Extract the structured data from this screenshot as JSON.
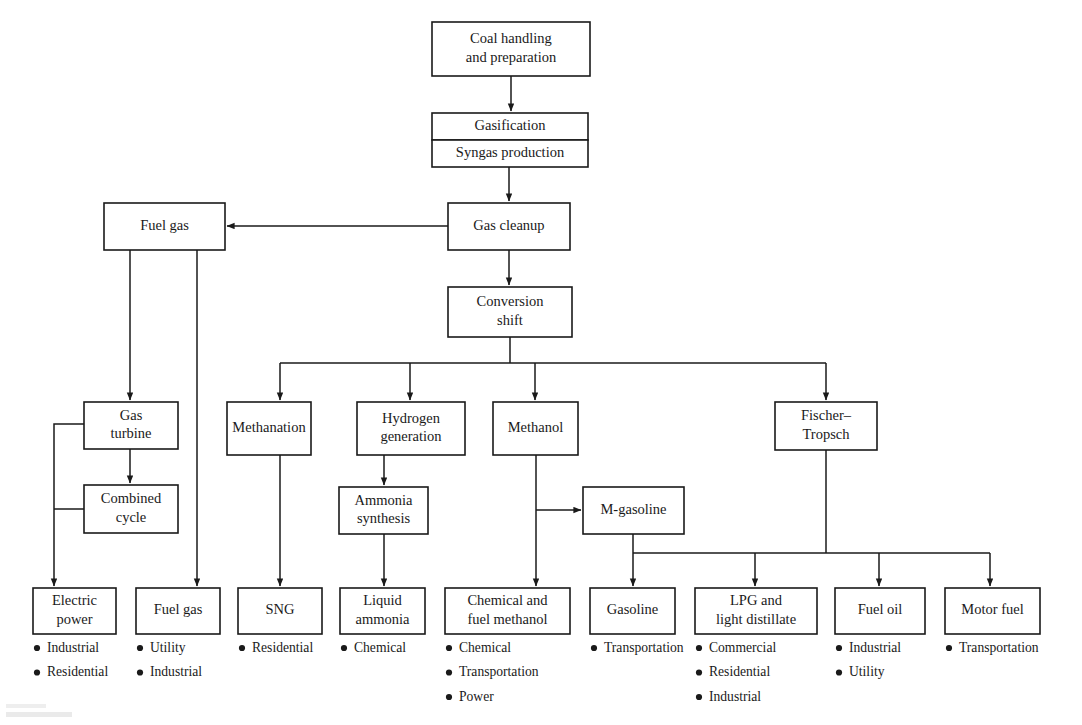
{
  "diagram": {
    "line_color": "#1a1a1a",
    "box_fill": "#ffffff",
    "background": "#ffffff",
    "nodes": [
      {
        "id": "coal_handling",
        "label_lines": [
          "Coal handling",
          "and preparation"
        ],
        "x": 432,
        "y": 22,
        "w": 158,
        "h": 54
      },
      {
        "id": "gasification",
        "label_lines": [
          "Gasification"
        ],
        "x": 432,
        "y": 113,
        "w": 156,
        "h": 27
      },
      {
        "id": "syngas",
        "label_lines": [
          "Syngas production"
        ],
        "x": 432,
        "y": 140,
        "w": 156,
        "h": 27
      },
      {
        "id": "fuel_gas_top",
        "label_lines": [
          "Fuel gas"
        ],
        "x": 104,
        "y": 203,
        "w": 121,
        "h": 47
      },
      {
        "id": "gas_cleanup",
        "label_lines": [
          "Gas cleanup"
        ],
        "x": 448,
        "y": 203,
        "w": 122,
        "h": 47
      },
      {
        "id": "conversion_shift",
        "label_lines": [
          "Conversion",
          "shift"
        ],
        "x": 448,
        "y": 287,
        "w": 124,
        "h": 50
      },
      {
        "id": "gas_turbine",
        "label_lines": [
          "Gas",
          "turbine"
        ],
        "x": 84,
        "y": 402,
        "w": 94,
        "h": 47
      },
      {
        "id": "methanation",
        "label_lines": [
          "Methanation"
        ],
        "x": 227,
        "y": 402,
        "w": 84,
        "h": 53
      },
      {
        "id": "hydrogen_gen",
        "label_lines": [
          "Hydrogen",
          "generation"
        ],
        "x": 357,
        "y": 402,
        "w": 108,
        "h": 53
      },
      {
        "id": "methanol",
        "label_lines": [
          "Methanol"
        ],
        "x": 493,
        "y": 402,
        "w": 85,
        "h": 53
      },
      {
        "id": "fischer_tropsch",
        "label_lines": [
          "Fischer–",
          "Tropsch"
        ],
        "x": 775,
        "y": 402,
        "w": 102,
        "h": 48
      },
      {
        "id": "combined_cycle",
        "label_lines": [
          "Combined",
          "cycle"
        ],
        "x": 84,
        "y": 485,
        "w": 94,
        "h": 48
      },
      {
        "id": "ammonia_synth",
        "label_lines": [
          "Ammonia",
          "synthesis"
        ],
        "x": 339,
        "y": 487,
        "w": 89,
        "h": 47
      },
      {
        "id": "m_gasoline",
        "label_lines": [
          "M-gasoline"
        ],
        "x": 583,
        "y": 487,
        "w": 101,
        "h": 47
      }
    ],
    "terminals": [
      {
        "id": "electric_power",
        "label_lines": [
          "Electric",
          "power"
        ],
        "x": 33,
        "y": 588,
        "w": 83,
        "h": 46,
        "bullets": [
          "Industrial",
          "Residential"
        ]
      },
      {
        "id": "fuel_gas_bottom",
        "label_lines": [
          "Fuel gas"
        ],
        "x": 136,
        "y": 588,
        "w": 84,
        "h": 46,
        "bullets": [
          "Utility",
          "Industrial"
        ]
      },
      {
        "id": "sng",
        "label_lines": [
          "SNG"
        ],
        "x": 238,
        "y": 588,
        "w": 84,
        "h": 46,
        "bullets": [
          "Residential"
        ]
      },
      {
        "id": "liquid_ammonia",
        "label_lines": [
          "Liquid",
          "ammonia"
        ],
        "x": 340,
        "y": 588,
        "w": 85,
        "h": 46,
        "bullets": [
          "Chemical"
        ]
      },
      {
        "id": "chem_fuel_meoh",
        "label_lines": [
          "Chemical and",
          "fuel methanol"
        ],
        "x": 445,
        "y": 588,
        "w": 125,
        "h": 46,
        "bullets": [
          "Chemical",
          "Transportation",
          "Power"
        ]
      },
      {
        "id": "gasoline",
        "label_lines": [
          "Gasoline"
        ],
        "x": 590,
        "y": 588,
        "w": 85,
        "h": 46,
        "bullets": [
          "Transportation"
        ]
      },
      {
        "id": "lpg_light_dist",
        "label_lines": [
          "LPG and",
          "light distillate"
        ],
        "x": 695,
        "y": 588,
        "w": 122,
        "h": 46,
        "bullets": [
          "Commercial",
          "Residential",
          "Industrial"
        ]
      },
      {
        "id": "fuel_oil",
        "label_lines": [
          "Fuel oil"
        ],
        "x": 835,
        "y": 588,
        "w": 90,
        "h": 46,
        "bullets": [
          "Industrial",
          "Utility"
        ]
      },
      {
        "id": "motor_fuel",
        "label_lines": [
          "Motor fuel"
        ],
        "x": 945,
        "y": 588,
        "w": 95,
        "h": 46,
        "bullets": [
          "Transportation"
        ]
      }
    ],
    "edges": [
      {
        "id": "coal-to-gasification",
        "from": "coal_handling",
        "to": "gasification",
        "points": "511,76 511,111",
        "arrow": true
      },
      {
        "id": "syngas-to-cleanup",
        "from": "syngas",
        "to": "gas_cleanup",
        "points": "509,167 509,201",
        "arrow": true
      },
      {
        "id": "cleanup-to-fuelgas",
        "from": "gas_cleanup",
        "to": "fuel_gas_top",
        "points": "448,226 227,226",
        "arrow": true
      },
      {
        "id": "cleanup-to-conversion",
        "from": "gas_cleanup",
        "to": "conversion_shift",
        "points": "509,250 509,285",
        "arrow": true
      },
      {
        "id": "fuelgas-to-gasturbine",
        "from": "fuel_gas_top",
        "to": "gas_turbine",
        "points": "130,250 130,400",
        "arrow": true
      },
      {
        "id": "fuelgas-to-fuelgas-bottom",
        "from": "fuel_gas_top",
        "to": "fuel_gas_bottom",
        "points": "197,250 197,586",
        "arrow": true
      },
      {
        "id": "conversion-trunk",
        "from": "conversion_shift",
        "to": "distribution-bar",
        "points": "510,337 510,363",
        "arrow": false
      },
      {
        "id": "bar-upper",
        "from": "conversion_shift",
        "to": "row2",
        "points": "280,363 826,363",
        "arrow": false
      },
      {
        "id": "bar-to-methanation",
        "from": "bar-upper",
        "to": "methanation",
        "points": "280,363 280,400",
        "arrow": true
      },
      {
        "id": "bar-to-hydrogen",
        "from": "bar-upper",
        "to": "hydrogen_gen",
        "points": "410,363 410,400",
        "arrow": true
      },
      {
        "id": "bar-to-methanol",
        "from": "bar-upper",
        "to": "methanol",
        "points": "535,363 535,400",
        "arrow": true
      },
      {
        "id": "bar-to-fischer",
        "from": "bar-upper",
        "to": "fischer_tropsch",
        "points": "826,363 826,400",
        "arrow": true
      },
      {
        "id": "gasturbine-to-combined",
        "from": "gas_turbine",
        "to": "combined_cycle",
        "points": "130,449 130,483",
        "arrow": true
      },
      {
        "id": "gasturbine-left-tap",
        "from": "gas_turbine",
        "to": "electric_power",
        "points": "84,424 54,424 54,586",
        "arrow": true
      },
      {
        "id": "combined-left-tap",
        "from": "combined_cycle",
        "to": "electric-riser",
        "points": "84,509 54,509",
        "arrow": false
      },
      {
        "id": "methanation-to-sng",
        "from": "methanation",
        "to": "sng",
        "points": "280,455 280,586",
        "arrow": true
      },
      {
        "id": "hydrogen-to-ammonia",
        "from": "hydrogen_gen",
        "to": "ammonia_synth",
        "points": "384,455 384,485",
        "arrow": true
      },
      {
        "id": "ammonia-to-liquid",
        "from": "ammonia_synth",
        "to": "liquid_ammonia",
        "points": "384,534 384,586",
        "arrow": true
      },
      {
        "id": "methanol-trunk",
        "from": "methanol",
        "to": "chem_fuel_meoh",
        "points": "536,455 536,586",
        "arrow": true
      },
      {
        "id": "methanol-to-mgasoline",
        "from": "methanol",
        "to": "m_gasoline",
        "points": "536,510 581,510",
        "arrow": true
      },
      {
        "id": "mgasoline-trunk",
        "from": "m_gasoline",
        "to": "lower-bar",
        "points": "633,534 633,553",
        "arrow": false
      },
      {
        "id": "lower-bar",
        "from": "m_gasoline",
        "to": "terminals",
        "points": "633,553 990,553",
        "arrow": false
      },
      {
        "id": "fischer-trunk",
        "from": "fischer_tropsch",
        "to": "lower-bar",
        "points": "826,450 826,553",
        "arrow": false
      },
      {
        "id": "lowerbar-to-gasoline",
        "from": "lower-bar",
        "to": "gasoline",
        "points": "633,553 633,586",
        "arrow": true
      },
      {
        "id": "lowerbar-to-lpg",
        "from": "lower-bar",
        "to": "lpg_light_dist",
        "points": "755,553 755,586",
        "arrow": true
      },
      {
        "id": "lowerbar-to-fueloil",
        "from": "lower-bar",
        "to": "fuel_oil",
        "points": "879,553 879,586",
        "arrow": true
      },
      {
        "id": "lowerbar-to-motorfuel",
        "from": "lower-bar",
        "to": "motor_fuel",
        "points": "990,553 990,586",
        "arrow": true
      }
    ]
  }
}
